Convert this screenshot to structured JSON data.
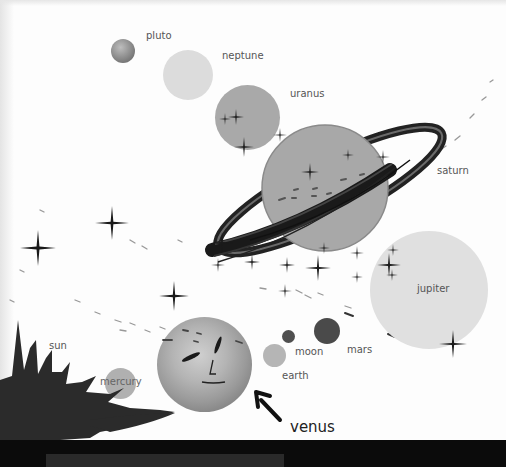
{
  "illustration": {
    "title": "Solar system",
    "planets": [
      {
        "name": "pluto",
        "label": "pluto"
      },
      {
        "name": "neptune",
        "label": "neptune"
      },
      {
        "name": "uranus",
        "label": "uranus"
      },
      {
        "name": "saturn",
        "label": "saturn"
      },
      {
        "name": "jupiter",
        "label": "jupiter"
      },
      {
        "name": "mars",
        "label": "mars"
      },
      {
        "name": "moon",
        "label": "moon"
      },
      {
        "name": "earth",
        "label": "earth"
      },
      {
        "name": "venus",
        "label": "venus"
      },
      {
        "name": "mercury",
        "label": "mercury"
      },
      {
        "name": "sun",
        "label": "sun"
      }
    ],
    "colors": {
      "pluto": "#8a8a8a",
      "neptune": "#dcdcdc",
      "uranus": "#a9a9a9",
      "saturn": "#a8a8a8",
      "jupiter": "#e0e0e0",
      "mars": "#4a4a4a",
      "moon": "#4f4f4f",
      "earth": "#b5b5b5",
      "venus": "#8e8e8e",
      "mercury": "#b0b0b0",
      "sun": "#2b2b2b",
      "stars": "#1a1a1a"
    }
  }
}
